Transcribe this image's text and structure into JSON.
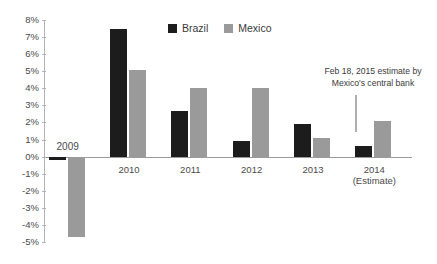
{
  "title": "",
  "legend": {
    "position": "top-center",
    "items": [
      {
        "label": "Brazil",
        "color": "#1c1c1c"
      },
      {
        "label": "Mexico",
        "color": "#9a9a9a"
      }
    ]
  },
  "annotation": {
    "line1": "Feb 18, 2015 estimate by",
    "line2": "Mexico's central bank"
  },
  "axis": {
    "y_ticks": [
      "8%",
      "7%",
      "6%",
      "5%",
      "4%",
      "3%",
      "2%",
      "1%",
      "0%",
      "-1%",
      "-2%",
      "-3%",
      "-4%",
      "-5%"
    ]
  },
  "x_labels": [
    {
      "main": "2009",
      "sub": ""
    },
    {
      "main": "2010",
      "sub": ""
    },
    {
      "main": "2011",
      "sub": ""
    },
    {
      "main": "2012",
      "sub": ""
    },
    {
      "main": "2013",
      "sub": ""
    },
    {
      "main": "2014",
      "sub": "(Estimate)"
    }
  ],
  "chart_data": {
    "type": "bar",
    "title": "",
    "xlabel": "",
    "ylabel": "",
    "ylim": [
      -5,
      8
    ],
    "ytick_step": 1,
    "grid": false,
    "legend_position": "top-center",
    "categories": [
      "2009",
      "2010",
      "2011",
      "2012",
      "2013",
      "2014 (Estimate)"
    ],
    "series": [
      {
        "name": "Brazil",
        "color": "#1c1c1c",
        "values": [
          -0.2,
          7.5,
          2.7,
          0.9,
          1.9,
          0.6
        ]
      },
      {
        "name": "Mexico",
        "color": "#9a9a9a",
        "values": [
          -4.7,
          5.1,
          4.0,
          4.0,
          1.1,
          2.1
        ]
      }
    ],
    "annotations": [
      {
        "text": "Feb 18, 2015 estimate by Mexico's central bank",
        "target_series": "Mexico",
        "target_category": "2014 (Estimate)"
      }
    ]
  }
}
